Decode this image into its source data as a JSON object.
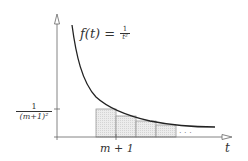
{
  "diagram": {
    "function_label": "f(t) = ",
    "function_num": "1",
    "function_den": "t²",
    "y_tick_num": "1",
    "y_tick_den": "(m+1)²",
    "x_tick_label": "m + 1",
    "x_axis_label": "t",
    "ellipsis": "· · ·",
    "colors": {
      "curve": "#222222",
      "axis": "#555555",
      "rect_fill": "#e6e6e6",
      "rect_stroke": "#999999"
    },
    "rectangles": [
      {
        "x": 96,
        "top": 109
      },
      {
        "x": 116,
        "top": 116
      },
      {
        "x": 136,
        "top": 121
      },
      {
        "x": 156,
        "top": 125
      }
    ]
  }
}
